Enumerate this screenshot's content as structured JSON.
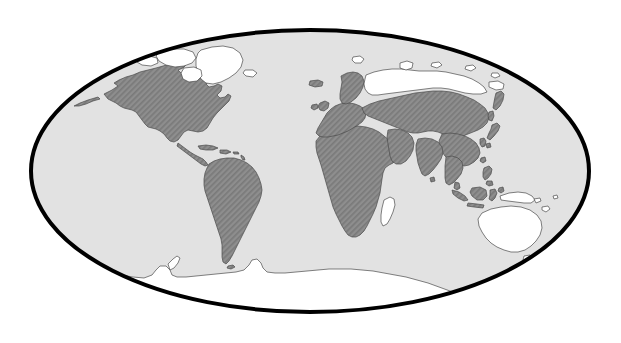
{
  "figure": {
    "kind": "world-map",
    "projection": "elliptical (Mollweide / Aitoff style)",
    "title": "",
    "caption": "",
    "canvas": {
      "width": 621,
      "height": 343,
      "background": "#ffffff"
    }
  },
  "colors": {
    "page_background": "#ffffff",
    "ocean_fill": "#e2e2e2",
    "graticule_border": "#000000",
    "highlighted_land_base": "#8e8e8e",
    "highlighted_land_hatch": "#7a7a7a",
    "unhighlighted_land_fill": "#ffffff",
    "coastline_stroke": "#4a4a4a"
  },
  "globe": {
    "center_x": 310,
    "center_y": 171,
    "radius_x": 279,
    "radius_y": 141,
    "border_width": 4
  },
  "legend": {
    "visible": false,
    "entries": [
      {
        "key": "highlighted",
        "label": "",
        "fill": "#8e8e8e",
        "pattern": "diagonal-hatch"
      },
      {
        "key": "not-highlighted",
        "label": "",
        "fill": "#ffffff",
        "pattern": "solid"
      }
    ]
  },
  "regions": {
    "highlighted": [
      "North America (mainland United States, Canada mainland, Alaska)",
      "Mexico and Central America",
      "Caribbean islands",
      "South America",
      "Africa (mainland)",
      "Europe",
      "Iceland",
      "Scandinavia",
      "Middle East and Arabian Peninsula",
      "Russia (southern belt) and Central Asia",
      "South Asia (India)",
      "China, Mongolia, Korea",
      "Japan",
      "Southeast Asia mainland",
      "Indonesia",
      "Philippines",
      "Borneo",
      "Sri Lanka",
      "Taiwan",
      "Sakhalin and Kamchatka"
    ],
    "not_highlighted": [
      "Greenland",
      "Canadian Arctic Archipelago",
      "Svalbard",
      "Northern Russia / Siberian Arctic coast",
      "Novaya Zemlya",
      "Australia",
      "New Zealand",
      "Papua New Guinea",
      "New Caledonia",
      "Fiji",
      "Tasmania",
      "Madagascar",
      "Antarctica"
    ]
  },
  "chart_data": {
    "type": "map",
    "title": "",
    "subtitle": "",
    "projection": "Mollweide/elliptical equal-area",
    "value_type": "binary-categorical",
    "categories": [
      "highlighted",
      "not-highlighted"
    ],
    "category_styles": {
      "highlighted": {
        "fill": "#8e8e8e",
        "hatch": "diagonal",
        "hatch_angle_deg": 45
      },
      "not-highlighted": {
        "fill": "#ffffff",
        "hatch": "none"
      }
    },
    "features": [
      {
        "name": "North America",
        "category": "highlighted"
      },
      {
        "name": "Central America",
        "category": "highlighted"
      },
      {
        "name": "Caribbean",
        "category": "highlighted"
      },
      {
        "name": "South America",
        "category": "highlighted"
      },
      {
        "name": "Africa",
        "category": "highlighted"
      },
      {
        "name": "Europe",
        "category": "highlighted"
      },
      {
        "name": "Iceland",
        "category": "highlighted"
      },
      {
        "name": "Middle East",
        "category": "highlighted"
      },
      {
        "name": "Central Asia",
        "category": "highlighted"
      },
      {
        "name": "South Asia",
        "category": "highlighted"
      },
      {
        "name": "East Asia",
        "category": "highlighted"
      },
      {
        "name": "Japan",
        "category": "highlighted"
      },
      {
        "name": "Southeast Asia",
        "category": "highlighted"
      },
      {
        "name": "Indonesia",
        "category": "highlighted"
      },
      {
        "name": "Philippines",
        "category": "highlighted"
      },
      {
        "name": "Greenland",
        "category": "not-highlighted"
      },
      {
        "name": "Canadian Arctic Archipelago",
        "category": "not-highlighted"
      },
      {
        "name": "Svalbard",
        "category": "not-highlighted"
      },
      {
        "name": "Northern Siberia",
        "category": "not-highlighted"
      },
      {
        "name": "Novaya Zemlya",
        "category": "not-highlighted"
      },
      {
        "name": "Australia",
        "category": "not-highlighted"
      },
      {
        "name": "New Zealand",
        "category": "not-highlighted"
      },
      {
        "name": "Papua New Guinea",
        "category": "not-highlighted"
      },
      {
        "name": "New Caledonia",
        "category": "not-highlighted"
      },
      {
        "name": "Fiji",
        "category": "not-highlighted"
      },
      {
        "name": "Tasmania",
        "category": "not-highlighted"
      },
      {
        "name": "Madagascar",
        "category": "not-highlighted"
      },
      {
        "name": "Antarctica",
        "category": "not-highlighted"
      }
    ],
    "legend_visible": false,
    "axis_labels": {
      "x": "",
      "y": ""
    },
    "grid": false
  }
}
